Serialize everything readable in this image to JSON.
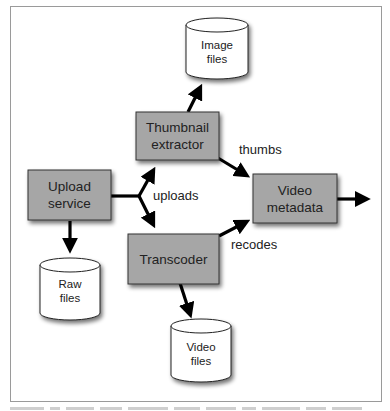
{
  "diagram": {
    "type": "data-flow",
    "nodes": [
      {
        "id": "upload_service",
        "shape": "process",
        "label_lines": [
          "Upload",
          "service"
        ]
      },
      {
        "id": "thumbnail_extractor",
        "shape": "process",
        "label_lines": [
          "Thumbnail",
          "extractor"
        ]
      },
      {
        "id": "transcoder",
        "shape": "process",
        "label_lines": [
          "Transcoder"
        ]
      },
      {
        "id": "video_metadata",
        "shape": "process",
        "label_lines": [
          "Video",
          "metadata"
        ]
      },
      {
        "id": "image_files",
        "shape": "datastore",
        "label_lines": [
          "Image",
          "files"
        ]
      },
      {
        "id": "raw_files",
        "shape": "datastore",
        "label_lines": [
          "Raw",
          "files"
        ]
      },
      {
        "id": "video_files",
        "shape": "datastore",
        "label_lines": [
          "Video",
          "files"
        ]
      }
    ],
    "edges": [
      {
        "from": "upload_service",
        "to": "thumbnail_extractor",
        "label": "uploads"
      },
      {
        "from": "upload_service",
        "to": "transcoder",
        "label": "uploads"
      },
      {
        "from": "upload_service",
        "to": "raw_files",
        "label": ""
      },
      {
        "from": "thumbnail_extractor",
        "to": "image_files",
        "label": ""
      },
      {
        "from": "thumbnail_extractor",
        "to": "video_metadata",
        "label": "thumbs"
      },
      {
        "from": "transcoder",
        "to": "video_metadata",
        "label": "recodes"
      },
      {
        "from": "transcoder",
        "to": "video_files",
        "label": ""
      },
      {
        "from": "video_metadata",
        "to": "(external output)",
        "label": ""
      }
    ],
    "edge_labels": {
      "uploads": "uploads",
      "thumbs": "thumbs",
      "recodes": "recodes"
    },
    "colors": {
      "process_fill": "#a6a6a6",
      "process_stroke": "#333333",
      "datastore_fill": "#ffffff",
      "arrow": "#000000",
      "frame": "#9a9a9a"
    }
  },
  "caption": {
    "visible": "clipped (unreadable)"
  }
}
